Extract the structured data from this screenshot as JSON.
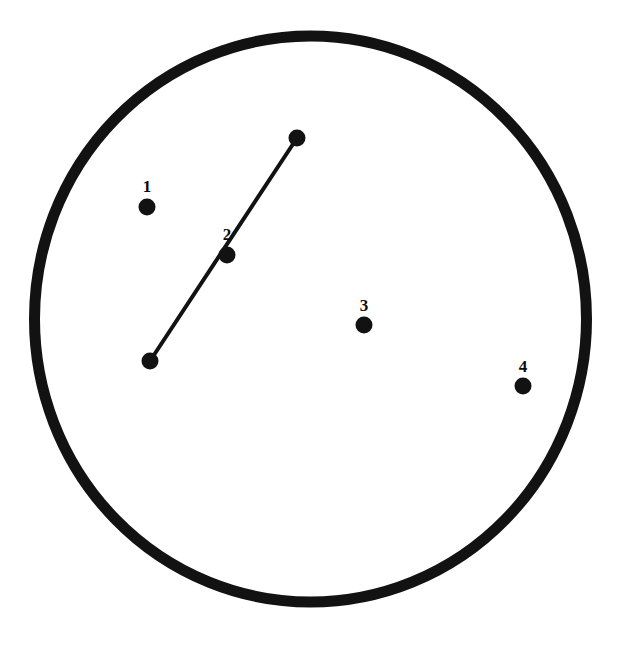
{
  "figure": {
    "title": "",
    "background_color": "#ffffff",
    "ink_color": "#121212",
    "width": 628,
    "height": 650
  },
  "boundary": {
    "name": "outer-circle",
    "shape": "ellipse",
    "center_x": 310.5,
    "center_y": 319,
    "radius_x": 276,
    "radius_y": 283,
    "stroke_width": 11,
    "stroke_color": "#121212",
    "fill": "none"
  },
  "chart_data": {
    "type": "scatter",
    "title": "",
    "xlabel": "",
    "ylabel": "",
    "xlim": [
      0,
      628
    ],
    "ylim": [
      0,
      650
    ],
    "grid": false,
    "legend": "none",
    "marker_color": "#121212",
    "marker_diameter": 17,
    "labeled_points": [
      {
        "label": "1",
        "x": 147,
        "y": 207,
        "label_x": 147,
        "label_y": 188
      },
      {
        "label": "2",
        "x": 227,
        "y": 255,
        "label_x": 227,
        "label_y": 236
      },
      {
        "label": "3",
        "x": 364,
        "y": 325,
        "label_x": 364,
        "label_y": 307
      },
      {
        "label": "4",
        "x": 523,
        "y": 386,
        "label_x": 523,
        "label_y": 368
      }
    ],
    "unlabeled_points": [
      {
        "label": "",
        "x": 297,
        "y": 138
      },
      {
        "label": "",
        "x": 150,
        "y": 361
      }
    ],
    "segments": [
      {
        "name": "connector-segment",
        "x1": 150,
        "y1": 361,
        "x2": 297,
        "y2": 138,
        "stroke_width": 4,
        "stroke_color": "#121212",
        "passes_through": "2"
      }
    ]
  }
}
